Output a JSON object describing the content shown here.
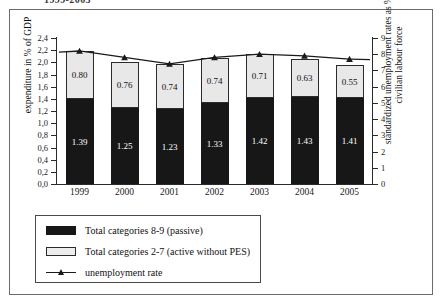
{
  "figure": {
    "title_clipped": "1999-2005"
  },
  "legend": {
    "items": [
      {
        "swatch": "dark-square",
        "label": "Total categories 8-9 (passive)"
      },
      {
        "swatch": "light-square",
        "label": "Total categories 2-7 (active without PES)"
      },
      {
        "swatch": "line-marker",
        "label": "unemployment rate"
      }
    ]
  },
  "chart_data": {
    "type": "bar",
    "subtype": "stacked-bar-with-line-overlay",
    "title": "1999-2005",
    "xlabel": "",
    "ylabel": "expenditure in % of GDP",
    "y2label": "standardized unemployment rates as % of civilian labour force",
    "categories": [
      "1999",
      "2000",
      "2001",
      "2002",
      "2003",
      "2004",
      "2005"
    ],
    "ylim": [
      0.0,
      2.4
    ],
    "y2lim": [
      0,
      9
    ],
    "yticks": [
      "0,0",
      "0,2",
      "0,4",
      "0,6",
      "0,8",
      "1,0",
      "1,2",
      "1,4",
      "1,6",
      "1,8",
      "2,0",
      "2,2",
      "2,4"
    ],
    "y2ticks": [
      "0",
      "1",
      "2",
      "3",
      "4",
      "5",
      "6",
      "7",
      "8",
      "9"
    ],
    "grid": false,
    "legend_position": "below-plot-left",
    "series": [
      {
        "name": "Total categories 8-9 (passive)",
        "axis": "left",
        "stack": "bottom",
        "color": "#171717",
        "values": [
          1.39,
          1.25,
          1.23,
          1.33,
          1.42,
          1.43,
          1.41
        ],
        "labels": [
          "1.39",
          "1.25",
          "1.23",
          "1.33",
          "1.42",
          "1.43",
          "1.41"
        ]
      },
      {
        "name": "Total categories 2-7 (active without PES)",
        "axis": "left",
        "stack": "top",
        "color": "#e8e8e8",
        "values": [
          0.8,
          0.76,
          0.74,
          0.74,
          0.71,
          0.63,
          0.55
        ],
        "labels": [
          "0.80",
          "0.76",
          "0.74",
          "0.74",
          "0.71",
          "0.63",
          "0.55"
        ]
      },
      {
        "name": "unemployment rate",
        "axis": "right",
        "type": "line",
        "marker": "triangle",
        "color": "#1a1a1a",
        "values": [
          8.2,
          7.8,
          7.4,
          7.8,
          8.0,
          7.9,
          7.7
        ]
      }
    ],
    "totals": [
      2.19,
      2.01,
      1.97,
      2.07,
      2.13,
      2.06,
      1.96
    ]
  }
}
